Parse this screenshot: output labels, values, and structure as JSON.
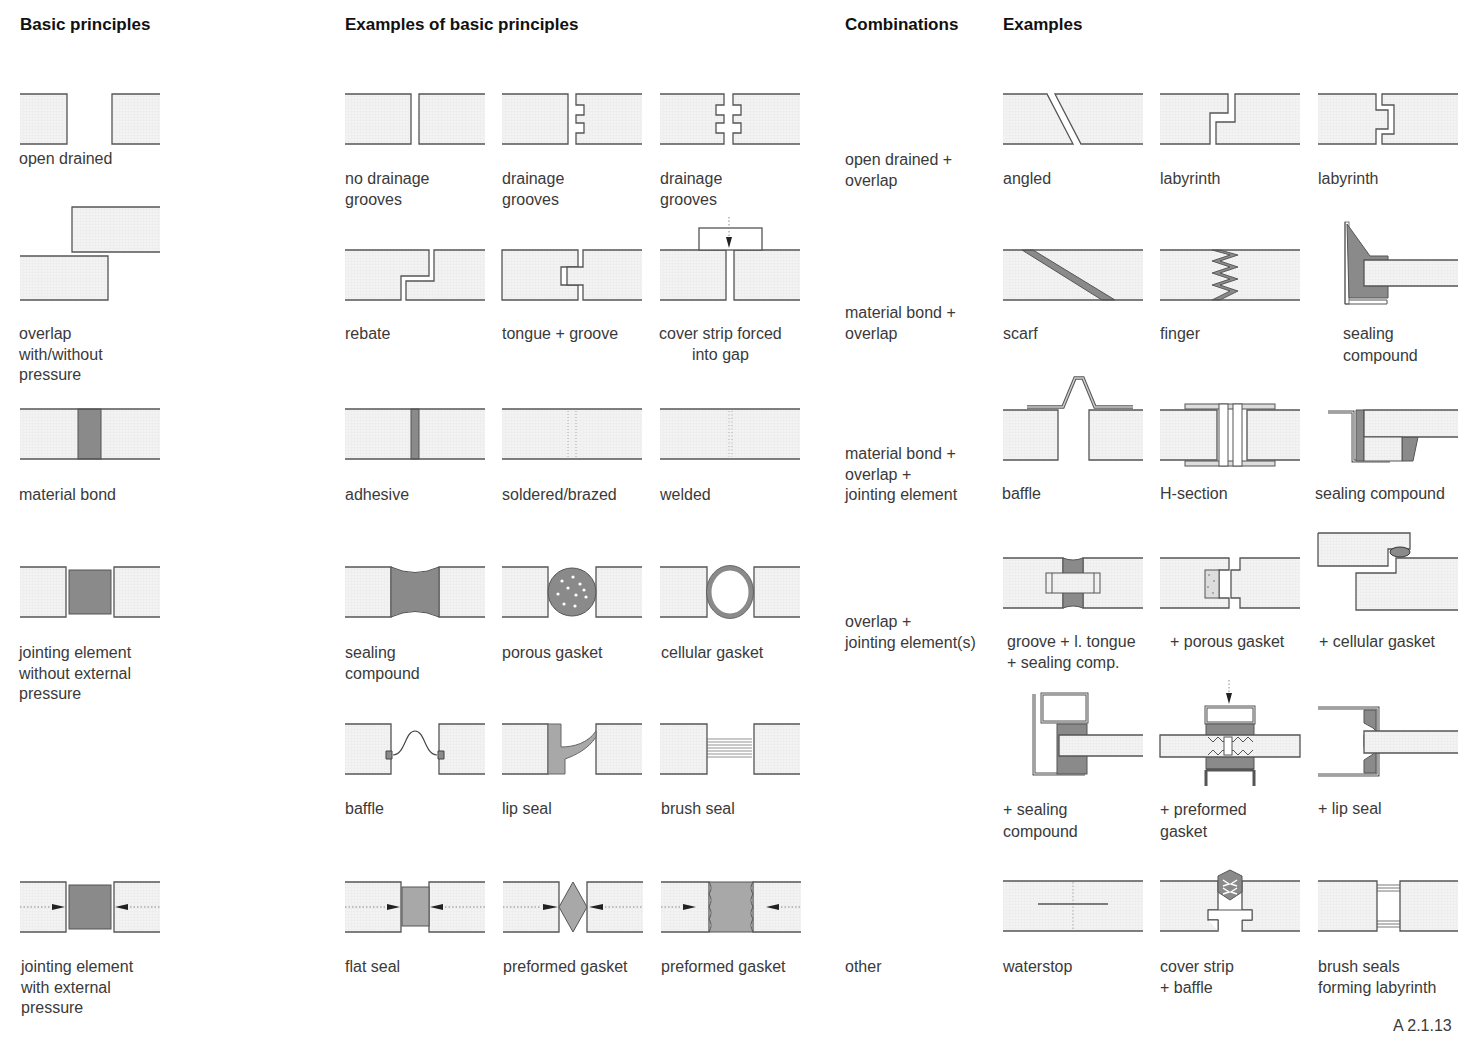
{
  "headers": {
    "basic": "Basic principles",
    "examples_basic": "Examples of basic principles",
    "combinations": "Combinations",
    "examples": "Examples"
  },
  "basic_principles": [
    {
      "label": "open drained"
    },
    {
      "label": "overlap\nwith/without\npressure"
    },
    {
      "label": "material bond"
    },
    {
      "label": "jointing element\nwithout external\npressure"
    },
    {
      "label": "jointing element\nwith external\npressure"
    }
  ],
  "examples_basic": [
    {
      "label": "no drainage\ngrooves"
    },
    {
      "label": "drainage\ngrooves"
    },
    {
      "label": "drainage\ngrooves"
    },
    {
      "label": "rebate"
    },
    {
      "label": "tongue + groove"
    },
    {
      "label": "cover strip forced\ninto gap"
    },
    {
      "label": "adhesive"
    },
    {
      "label": "soldered/brazed"
    },
    {
      "label": "welded"
    },
    {
      "label": "sealing\ncompound"
    },
    {
      "label": "porous gasket"
    },
    {
      "label": "cellular gasket"
    },
    {
      "label": "baffle"
    },
    {
      "label": "lip seal"
    },
    {
      "label": "brush seal"
    },
    {
      "label": "flat seal"
    },
    {
      "label": "preformed gasket"
    },
    {
      "label": "preformed gasket"
    }
  ],
  "combinations": [
    {
      "label": "open drained +\noverlap"
    },
    {
      "label": "material bond +\noverlap"
    },
    {
      "label": "material bond +\noverlap +\njointing element"
    },
    {
      "label": "overlap +\njointing element(s)"
    },
    {
      "label": "other"
    }
  ],
  "examples": [
    {
      "label": "angled"
    },
    {
      "label": "labyrinth"
    },
    {
      "label": "labyrinth"
    },
    {
      "label": "scarf"
    },
    {
      "label": "finger"
    },
    {
      "label": "sealing\ncompound"
    },
    {
      "label": "baffle"
    },
    {
      "label": "H-section"
    },
    {
      "label": "sealing compound"
    },
    {
      "label": "groove + l. tongue\n+ sealing comp."
    },
    {
      "label": "+ porous gasket"
    },
    {
      "label": "+ cellular gasket"
    },
    {
      "label": "+ sealing\ncompound"
    },
    {
      "label": "+ preformed\ngasket"
    },
    {
      "label": "+ lip seal"
    },
    {
      "label": "waterstop"
    },
    {
      "label": "cover strip\n+ baffle"
    },
    {
      "label": "brush seals\nforming labyrinth"
    }
  ],
  "figure_ref": "A 2.1.13",
  "colors": {
    "panel_fill": "#f1f1f1",
    "line": "#555555",
    "seal_fill": "#8a8a8a",
    "light_seal_fill": "#a8a8a8"
  }
}
